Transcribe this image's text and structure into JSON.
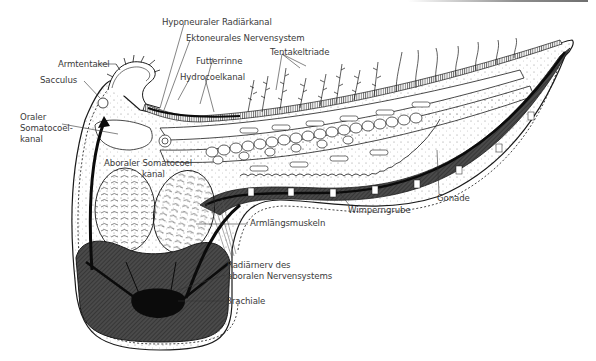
{
  "figure": {
    "colors": {
      "outline": "#1a1a1a",
      "muscle_dark": "#3c3c3c",
      "nerve_black": "#0b0b0b",
      "label_text": "#3a3a3a",
      "background": "#ffffff"
    }
  },
  "labels": {
    "hyponeuraler_radiaerkanal": "Hyponeuraler Radiärkanal",
    "ektoneurales_nervensystem": "Ektoneurales Nervensystem",
    "tentakeltriade": "Tentakeltriade",
    "armtentakel": "Armtentakel",
    "futterrinne": "Futterrinne",
    "hydrocoelkanal": "Hydrocoelkanal",
    "sacculus": "Sacculus",
    "oraler_somatocoelkanal_1": "Oraler",
    "oraler_somatocoelkanal_2": "Somatocoel-",
    "oraler_somatocoelkanal_3": "kanal",
    "aboraler_somatocoelkanal_1": "Aboraler Somatocoel",
    "aboraler_somatocoelkanal_2": "kanal",
    "gonade": "Gonade",
    "wimperngrube": "Wimperngrube",
    "armlaengsmuskeln": "Armlängsmuskeln",
    "radiaernerv_1": "Radiärnerv des",
    "radiaernerv_2": "aboralen Nervensystems",
    "brachiale": "Brachiale"
  }
}
